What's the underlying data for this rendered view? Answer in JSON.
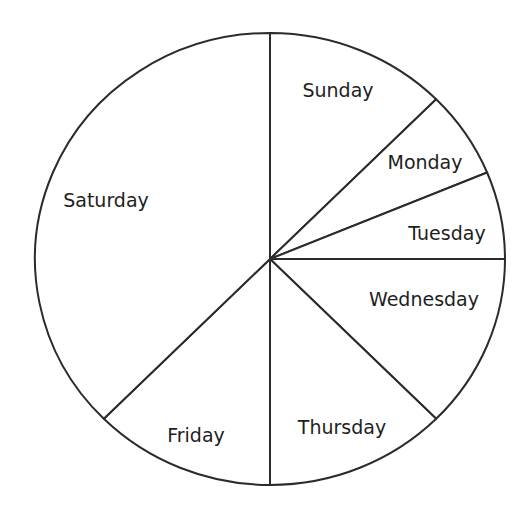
{
  "chart_data": {
    "type": "pie",
    "title": "",
    "start_angle_deg": 0,
    "direction": "clockwise",
    "categories": [
      "Sunday",
      "Monday",
      "Tuesday",
      "Wednesday",
      "Thursday",
      "Friday",
      "Saturday"
    ],
    "values": [
      12.5,
      6.25,
      6.25,
      12.5,
      12.5,
      12.5,
      37.5
    ],
    "slices": [
      {
        "label": "Sunday",
        "value": 12.5,
        "label_x": 338,
        "label_y": 91
      },
      {
        "label": "Monday",
        "value": 6.25,
        "label_x": 425,
        "label_y": 163
      },
      {
        "label": "Tuesday",
        "value": 6.25,
        "label_x": 447,
        "label_y": 234
      },
      {
        "label": "Wednesday",
        "value": 12.5,
        "label_x": 424,
        "label_y": 300
      },
      {
        "label": "Thursday",
        "value": 12.5,
        "label_x": 342,
        "label_y": 428
      },
      {
        "label": "Friday",
        "value": 12.5,
        "label_x": 196,
        "label_y": 436
      },
      {
        "label": "Saturday",
        "value": 37.5,
        "label_x": 106,
        "label_y": 201
      }
    ],
    "legend": "none",
    "grid": false,
    "colors": {
      "fill": "#ffffff",
      "stroke": "#2b2b2b",
      "text": "#1e1e1e"
    }
  }
}
